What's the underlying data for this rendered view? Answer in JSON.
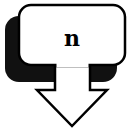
{
  "icon": {
    "label": "n",
    "description": "box-with-down-arrow",
    "colors": {
      "outline": "#000000",
      "fill": "#ffffff",
      "shadow": "#111111"
    }
  }
}
